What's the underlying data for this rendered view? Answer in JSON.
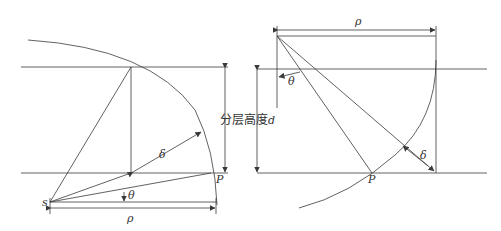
{
  "diagram": {
    "center_label": "分层高度",
    "center_label_var": "d",
    "left": {
      "labels": {
        "s": "s",
        "P": "P",
        "rho": "ρ",
        "theta": "θ",
        "delta": "δ"
      }
    },
    "right": {
      "labels": {
        "P": "P",
        "rho": "ρ",
        "theta": "θ",
        "delta": "δ"
      }
    },
    "colors": {
      "line": "#3a3a3a",
      "text": "#333333",
      "background": "#ffffff"
    }
  }
}
